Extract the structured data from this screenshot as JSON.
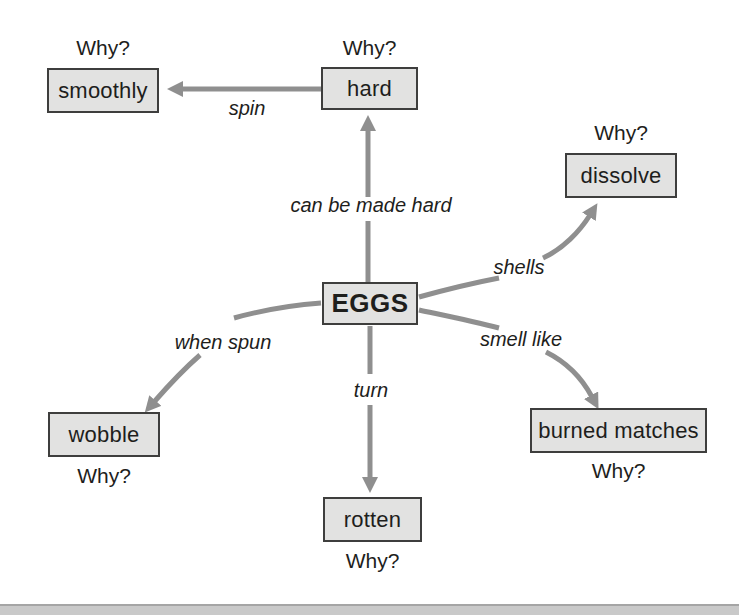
{
  "diagram_title": "EGGS concept map",
  "center": {
    "label": "EGGS"
  },
  "nodes": [
    {
      "id": "smoothly",
      "label": "smoothly",
      "why": "Why?"
    },
    {
      "id": "hard",
      "label": "hard",
      "why": "Why?"
    },
    {
      "id": "dissolve",
      "label": "dissolve",
      "why": "Why?"
    },
    {
      "id": "wobble",
      "label": "wobble",
      "why": "Why?"
    },
    {
      "id": "rotten",
      "label": "rotten",
      "why": "Why?"
    },
    {
      "id": "burned-matches",
      "label": "burned matches",
      "why": "Why?"
    }
  ],
  "edges": [
    {
      "id": "spin",
      "from": "hard",
      "to": "smoothly",
      "label": "spin"
    },
    {
      "id": "can-be-made-hard",
      "from": "EGGS",
      "to": "hard",
      "label": "can be made hard"
    },
    {
      "id": "shells",
      "from": "EGGS",
      "to": "dissolve",
      "label": "shells"
    },
    {
      "id": "when-spun",
      "from": "EGGS",
      "to": "wobble",
      "label": "when spun"
    },
    {
      "id": "turn",
      "from": "EGGS",
      "to": "rotten",
      "label": "turn"
    },
    {
      "id": "smell-like",
      "from": "EGGS",
      "to": "burned matches",
      "label": "smell like"
    }
  ],
  "colors": {
    "box_fill": "#e2e2e1",
    "box_border": "#3e3e3d",
    "arrow": "#8f8f8f",
    "text": "#1e1e1c",
    "page_edge": "#c9c9c9",
    "page_edge_line": "#a5a5a5"
  }
}
